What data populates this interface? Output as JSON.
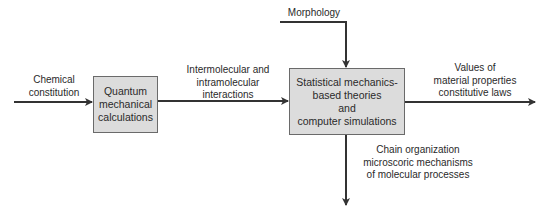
{
  "diagram": {
    "colors": {
      "box_fill": "#dcdcdc",
      "box_border": "#6a6a6a",
      "arrow": "#333333",
      "text": "#2a2a2a"
    },
    "nodes": {
      "quantum": {
        "lines": [
          "Quantum",
          "mechanical",
          "calculations"
        ]
      },
      "statistical": {
        "lines": [
          "Statistical mechanics-",
          "based theories",
          "and",
          "computer simulations"
        ]
      }
    },
    "labels": {
      "chemical": [
        "Chemical",
        "constitution"
      ],
      "interactions": [
        "Intermolecular and",
        "intramolecular",
        "interactions"
      ],
      "morphology": [
        "Morphology"
      ],
      "values": [
        "Values of",
        "material properties",
        "constitutive laws"
      ],
      "chain": [
        "Chain organization",
        "microscoric mechanisms",
        "of molecular processes"
      ]
    },
    "edges": [
      {
        "from": "Chemical constitution",
        "to": "Quantum mechanical calculations"
      },
      {
        "from": "Quantum mechanical calculations",
        "to": "Statistical mechanics-based theories and computer simulations",
        "label": "Intermolecular and intramolecular interactions"
      },
      {
        "from": "Morphology",
        "to": "Statistical mechanics-based theories and computer simulations"
      },
      {
        "from": "Statistical mechanics-based theories and computer simulations",
        "to": "Values of material properties constitutive laws"
      },
      {
        "from": "Statistical mechanics-based theories and computer simulations",
        "to": "Chain organization microscoric mechanisms of molecular processes"
      }
    ]
  }
}
